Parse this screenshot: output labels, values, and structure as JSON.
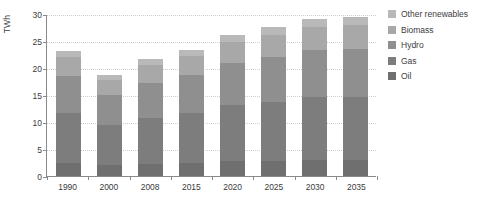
{
  "chart_data": {
    "type": "bar",
    "title": "",
    "subtitle": "",
    "xlabel": "",
    "ylabel": "TWh",
    "categories": [
      "1990",
      "2000",
      "2008",
      "2015",
      "2020",
      "2025",
      "2030",
      "2035"
    ],
    "values": [
      23.0,
      18.6,
      21.5,
      23.3,
      26.0,
      27.6,
      29.0,
      29.3
    ],
    "series": [
      {
        "name": "Oil",
        "color": "#6f6f6f",
        "values": [
          2.3,
          1.9,
          2.1,
          2.3,
          2.6,
          2.7,
          2.9,
          2.9
        ]
      },
      {
        "name": "Gas",
        "color": "#7d7d7d",
        "values": [
          9.2,
          7.4,
          8.6,
          9.3,
          10.4,
          11.0,
          11.6,
          11.7
        ]
      },
      {
        "name": "Hydro",
        "color": "#8f8f8f",
        "values": [
          6.9,
          5.6,
          6.5,
          7.0,
          7.8,
          8.3,
          8.7,
          8.8
        ]
      },
      {
        "name": "Biomass",
        "color": "#a8a8a8",
        "values": [
          3.5,
          2.8,
          3.2,
          3.5,
          3.9,
          4.1,
          4.4,
          4.4
        ]
      },
      {
        "name": "Other renewables",
        "color": "#b9b9b9",
        "values": [
          1.1,
          0.9,
          1.1,
          1.2,
          1.3,
          1.5,
          1.4,
          1.5
        ]
      }
    ],
    "ylim": [
      0,
      30
    ],
    "yticks": [
      0,
      5,
      10,
      15,
      20,
      25,
      30
    ],
    "ytick_labels": [
      "0",
      "5",
      "10",
      "15",
      "20",
      "25",
      "30"
    ],
    "grid": true,
    "legend_position": "right",
    "axis_color": "#8a8a8a",
    "grid_color": "#cfcfcf",
    "text_color": "#3c3c3c",
    "background": "#ffffff"
  },
  "legend": {
    "items": [
      {
        "label": "Other renewables",
        "color": "#b9b9b9"
      },
      {
        "label": "Biomass",
        "color": "#a8a8a8"
      },
      {
        "label": "Hydro",
        "color": "#8f8f8f"
      },
      {
        "label": "Gas",
        "color": "#7d7d7d"
      },
      {
        "label": "Oil",
        "color": "#6f6f6f"
      }
    ]
  }
}
